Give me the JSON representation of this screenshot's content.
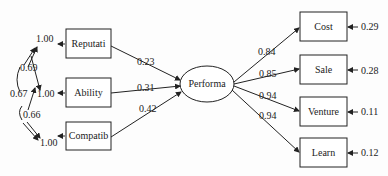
{
  "diagram": {
    "type": "structural-equation-model",
    "exogenous": [
      {
        "id": "reputati",
        "label": "Reputati",
        "variance": "1.00",
        "path_to_performa": "0.23"
      },
      {
        "id": "ability",
        "label": "Ability",
        "variance": "1.00",
        "path_to_performa": "0.31"
      },
      {
        "id": "compatib",
        "label": "Compatib",
        "variance": "1.00",
        "path_to_performa": "0.42"
      }
    ],
    "covariances": [
      {
        "between": [
          "reputati",
          "ability"
        ],
        "value": "0.69"
      },
      {
        "between": [
          "reputati",
          "compatib"
        ],
        "value": "0.67"
      },
      {
        "between": [
          "ability",
          "compatib"
        ],
        "value": "0.66"
      }
    ],
    "latent": {
      "id": "performa",
      "label": "Performa"
    },
    "indicators": [
      {
        "id": "cost",
        "label": "Cost",
        "loading": "0.84",
        "error": "0.29"
      },
      {
        "id": "sale",
        "label": "Sale",
        "loading": "0.85",
        "error": "0.28"
      },
      {
        "id": "venture",
        "label": "Venture",
        "loading": "0.94",
        "error": "0.11"
      },
      {
        "id": "learn",
        "label": "Learn",
        "loading": "0.94",
        "error": "0.12"
      }
    ]
  }
}
